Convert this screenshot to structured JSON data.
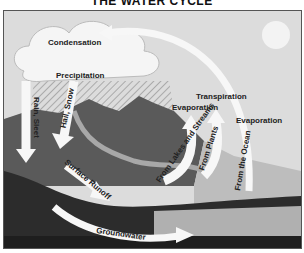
{
  "title": "THE WATER CYCLE",
  "labels": {
    "condensation": "Condensation",
    "precipitation": "Precipitation",
    "rain_sleet": "Rain, Sleet",
    "hail_snow": "Hail, Snow",
    "surface_runoff": "Surface Runoff",
    "groundwater": "Groundwater",
    "evaporation_lakes": "Evaporation",
    "from_lakes": "From Lakes and Streams",
    "transpiration": "Transpiration",
    "from_plants": "From Plants",
    "evaporation_ocean": "Evaporation",
    "from_ocean": "From the Ocean"
  },
  "colors": {
    "sky": "#d9d9d9",
    "sun": "#f2f2f2",
    "cloud": "#f5f5f5",
    "mountain": "#5a5a5a",
    "ground_dark": "#2a2a2a",
    "ocean": "#b8b8b8",
    "arrow": "#fafafa"
  }
}
